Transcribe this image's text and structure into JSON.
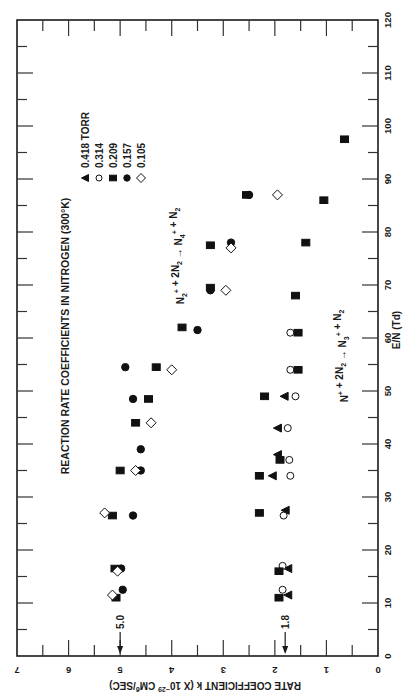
{
  "chart_data": {
    "type": "scatter",
    "title": "REACTION RATE COEFFICIENTS IN NITROGEN (300°K)",
    "xlabel": "E/N (Td)",
    "ylabel": "RATE COEFFICIENT k (X 10^-29 CM^6/SEC)",
    "xlim": [
      0,
      120
    ],
    "ylim": [
      0,
      7
    ],
    "x_ticks": [
      0,
      10,
      20,
      30,
      40,
      50,
      60,
      70,
      80,
      90,
      100,
      110,
      120
    ],
    "y_ticks": [
      0,
      1,
      2,
      3,
      4,
      5,
      6,
      7
    ],
    "orientation": "figure rotated 90° counter-clockwise (E/N axis runs vertically on right, k axis runs horizontally at bottom)",
    "grid": false,
    "legend": {
      "title_suffix": "TORR",
      "position": "upper-left (rotated)",
      "entries": [
        {
          "pressure": "0.418",
          "marker": "triangle-filled",
          "label": "0.418 TORR"
        },
        {
          "pressure": "0.314",
          "marker": "circle-open",
          "label": "0.314"
        },
        {
          "pressure": "0.209",
          "marker": "square-filled",
          "label": "0.209"
        },
        {
          "pressure": "0.157",
          "marker": "circle-filled",
          "label": "0.157"
        },
        {
          "pressure": "0.105",
          "marker": "diamond-open",
          "label": "0.105"
        }
      ]
    },
    "annotations": [
      {
        "text": "N2+ + 2N2 → N4+ + N2",
        "near": "upper data group (k≈3–5)"
      },
      {
        "text": "N+ + 2N2 → N3+ + N2",
        "near": "lower data group (k≈1–2)"
      },
      {
        "text": "5.0",
        "type": "arrow",
        "k": 5.0,
        "note": "low-field limit, N2+ reaction"
      },
      {
        "text": "1.8",
        "type": "arrow",
        "k": 1.8,
        "note": "low-field limit, N+ reaction"
      }
    ],
    "series": [
      {
        "name": "0.418 TORR",
        "marker": "triangle-filled",
        "group": "N+ reaction",
        "points": [
          [
            11.5,
            1.75
          ],
          [
            16.5,
            1.75
          ],
          [
            27.5,
            1.8
          ],
          [
            34,
            2.05
          ],
          [
            38,
            1.95
          ],
          [
            43,
            1.95
          ],
          [
            49,
            1.82
          ]
        ]
      },
      {
        "name": "0.314",
        "marker": "circle-open",
        "group": "N+ reaction",
        "points": [
          [
            12.5,
            1.85
          ],
          [
            17,
            1.85
          ],
          [
            26.5,
            1.83
          ],
          [
            34,
            1.7
          ],
          [
            37,
            1.72
          ],
          [
            43,
            1.75
          ],
          [
            49,
            1.6
          ],
          [
            54,
            1.7
          ],
          [
            61,
            1.7
          ]
        ]
      },
      {
        "name": "0.209",
        "marker": "square-filled",
        "group": "both",
        "points": [
          [
            11,
            5.08
          ],
          [
            16.5,
            5.1
          ],
          [
            26.5,
            5.15
          ],
          [
            35,
            5.0
          ],
          [
            44,
            4.7
          ],
          [
            48.5,
            4.45
          ],
          [
            54.5,
            4.3
          ],
          [
            62,
            3.8
          ],
          [
            69.5,
            3.25
          ],
          [
            77.5,
            3.25
          ],
          [
            87,
            2.55
          ],
          [
            11,
            1.92
          ],
          [
            16,
            1.92
          ],
          [
            27,
            2.3
          ],
          [
            34,
            2.3
          ],
          [
            37,
            1.9
          ],
          [
            49,
            2.2
          ],
          [
            54,
            1.55
          ],
          [
            61,
            1.55
          ],
          [
            68,
            1.6
          ],
          [
            78,
            1.4
          ],
          [
            86,
            1.05
          ],
          [
            97.5,
            0.65
          ]
        ]
      },
      {
        "name": "0.157",
        "marker": "circle-filled",
        "group": "N2+ reaction",
        "points": [
          [
            12.5,
            4.95
          ],
          [
            16.5,
            4.98
          ],
          [
            26.5,
            4.75
          ],
          [
            35,
            4.6
          ],
          [
            39,
            4.6
          ],
          [
            48.5,
            4.75
          ],
          [
            54.5,
            4.9
          ],
          [
            61.5,
            3.5
          ],
          [
            69,
            3.25
          ],
          [
            78,
            2.85
          ],
          [
            87,
            2.5
          ]
        ]
      },
      {
        "name": "0.105",
        "marker": "diamond-open",
        "group": "N2+ reaction",
        "points": [
          [
            11.5,
            5.15
          ],
          [
            16,
            5.05
          ],
          [
            27,
            5.3
          ],
          [
            35,
            4.7
          ],
          [
            44,
            4.4
          ],
          [
            54,
            4.0
          ],
          [
            69,
            2.95
          ],
          [
            77,
            2.85
          ],
          [
            87,
            1.95
          ]
        ]
      }
    ]
  },
  "figure": {
    "title": "REACTION RATE COEFFICIENTS IN NITROGEN (300°K)",
    "legend_title": "TORR",
    "x_axis_title": "E/N (Td)",
    "k_axis_title": "RATE COEFFICIENT k (X 10",
    "k_axis_exp": "−29",
    "k_axis_unit": " CM",
    "k_axis_unit_exp": "6",
    "k_axis_tail": "/SEC)",
    "reaction_upper": {
      "a": "N",
      "a_sub": "2",
      "a_sup": "+",
      "b": " + 2N",
      "b_sub": "2",
      "arrow": " → N",
      "c_sub": "4",
      "c_sup": "+",
      "d": " + N",
      "d_sub": "2"
    },
    "reaction_lower": {
      "a": "N",
      "a_sup": "+",
      "b": " + 2N",
      "b_sub": "2",
      "arrow": " → N",
      "c_sub": "3",
      "c_sup": "+",
      "d": " + N",
      "d_sub": "2"
    },
    "arrow_upper_label": "5.0",
    "arrow_lower_label": "1.8"
  },
  "colors": {
    "ink": "#1a1a1a",
    "background": "#ffffff"
  }
}
